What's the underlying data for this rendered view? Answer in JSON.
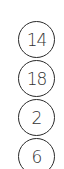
{
  "badges": [
    {
      "label": "14"
    },
    {
      "label": "18"
    },
    {
      "label": "2"
    },
    {
      "label": "6"
    }
  ],
  "colors": {
    "stroke": "#2a2a2a",
    "text": "#333333",
    "background": "#ffffff"
  }
}
